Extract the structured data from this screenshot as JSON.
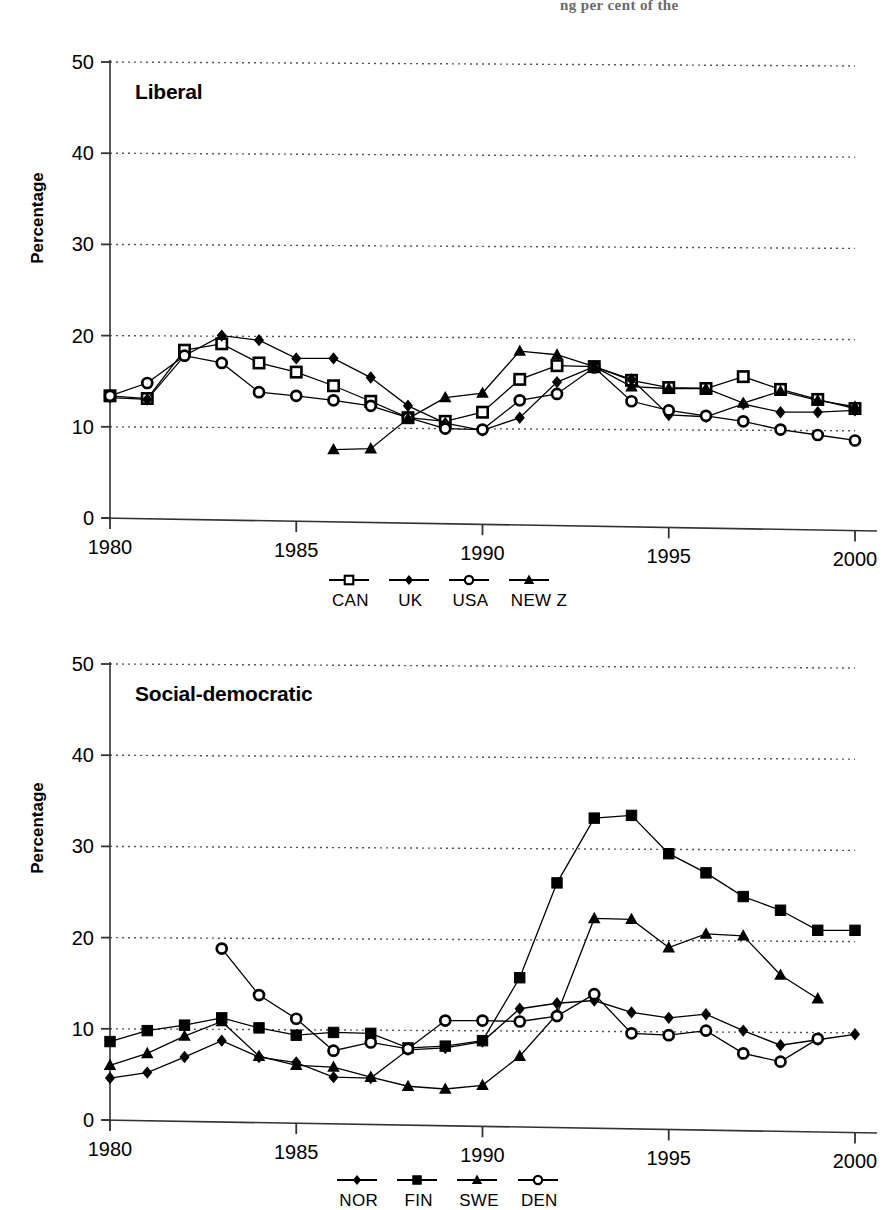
{
  "page": {
    "partial_header_text": "ng per cent of the"
  },
  "charts": [
    {
      "id": "liberal",
      "title": "Liberal",
      "ylabel": "Percentage",
      "xlabel": "",
      "type": "line",
      "xticks": [
        1980,
        1985,
        1990,
        1995,
        2000
      ],
      "xtick_labels": [
        "1980",
        "1985",
        "1990",
        "1995",
        "2000"
      ],
      "yticks": [
        0,
        10,
        20,
        30,
        40,
        50
      ],
      "ytick_labels": [
        "0",
        "10",
        "20",
        "30",
        "40",
        "50"
      ],
      "xlim": [
        1980,
        2000
      ],
      "ylim": [
        0,
        50
      ],
      "grid": "horizontal-dotted",
      "legend_position": "bottom",
      "series": [
        {
          "name": "CAN",
          "marker": "open-square",
          "x": [
            1980,
            1981,
            1982,
            1983,
            1984,
            1985,
            1986,
            1987,
            1988,
            1989,
            1990,
            1991,
            1992,
            1993,
            1994,
            1995,
            1996,
            1997,
            1998,
            1999,
            2000
          ],
          "values": [
            13.4,
            13.1,
            18.4,
            19.1,
            17.0,
            16.0,
            14.5,
            12.8,
            11.0,
            10.6,
            11.6,
            15.2,
            16.7,
            16.6,
            15.1,
            14.3,
            14.2,
            15.5,
            14.1,
            13.0,
            12.0
          ]
        },
        {
          "name": "UK",
          "marker": "filled-diamond",
          "x": [
            1980,
            1981,
            1982,
            1983,
            1984,
            1985,
            1986,
            1987,
            1988,
            1989,
            1990,
            1991,
            1992,
            1993,
            1994,
            1995,
            1996,
            1997,
            1998,
            1999,
            2000
          ],
          "values": [
            13.2,
            13.0,
            17.8,
            20.0,
            19.5,
            17.5,
            17.5,
            15.4,
            12.3,
            10.4,
            9.6,
            11.0,
            14.9,
            16.6,
            15.2,
            11.3,
            11.1,
            12.5,
            11.6,
            11.6,
            11.8
          ]
        },
        {
          "name": "USA",
          "marker": "open-circle",
          "x": [
            1980,
            1981,
            1982,
            1983,
            1984,
            1985,
            1986,
            1987,
            1988,
            1989,
            1990,
            1991,
            1992,
            1993,
            1994,
            1995,
            1996,
            1997,
            1998,
            1999,
            2000
          ],
          "values": [
            13.4,
            14.8,
            17.8,
            17.0,
            13.8,
            13.4,
            12.9,
            12.3,
            11.0,
            9.8,
            9.7,
            12.9,
            13.6,
            16.5,
            12.8,
            11.8,
            11.2,
            10.6,
            9.7,
            9.1,
            8.5
          ]
        },
        {
          "name": "NEW Z",
          "marker": "filled-triangle",
          "x": [
            1986,
            1987,
            1988,
            1989,
            1990,
            1991,
            1992,
            1993,
            1994,
            1995,
            1996,
            1997,
            1998,
            1999,
            2000
          ],
          "values": [
            7.5,
            7.6,
            10.9,
            13.2,
            13.7,
            18.3,
            17.9,
            16.6,
            14.4,
            14.2,
            14.2,
            12.6,
            13.9,
            12.9,
            12.2
          ]
        }
      ]
    },
    {
      "id": "social-democratic",
      "title": "Social-democratic",
      "ylabel": "Percentage",
      "xlabel": "",
      "type": "line",
      "xticks": [
        1980,
        1985,
        1990,
        1995,
        2000
      ],
      "xtick_labels": [
        "1980",
        "1985",
        "1990",
        "1995",
        "2000"
      ],
      "yticks": [
        0,
        10,
        20,
        30,
        40,
        50
      ],
      "ytick_labels": [
        "0",
        "10",
        "20",
        "30",
        "40",
        "50"
      ],
      "xlim": [
        1980,
        2000
      ],
      "ylim": [
        0,
        50
      ],
      "grid": "horizontal-dotted",
      "legend_position": "bottom",
      "series": [
        {
          "name": "NOR",
          "marker": "filled-diamond",
          "x": [
            1980,
            1981,
            1982,
            1983,
            1984,
            1985,
            1986,
            1987,
            1988,
            1989,
            1990,
            1991,
            1992,
            1993,
            1994,
            1995,
            1996,
            1997,
            1998,
            1999,
            2000
          ],
          "values": [
            4.6,
            5.2,
            6.9,
            8.7,
            6.9,
            6.3,
            4.7,
            4.6,
            7.7,
            7.9,
            8.6,
            12.2,
            12.8,
            13.1,
            11.8,
            11.2,
            11.6,
            9.8,
            8.2,
            8.8,
            9.4
          ]
        },
        {
          "name": "FIN",
          "marker": "filled-square",
          "x": [
            1980,
            1981,
            1982,
            1983,
            1984,
            1985,
            1986,
            1987,
            1988,
            1989,
            1990,
            1991,
            1992,
            1993,
            1994,
            1995,
            1996,
            1997,
            1998,
            1999,
            2000
          ],
          "values": [
            8.6,
            9.8,
            10.4,
            11.2,
            10.1,
            9.3,
            9.6,
            9.5,
            7.9,
            8.1,
            8.7,
            15.6,
            26.0,
            33.1,
            33.4,
            29.2,
            27.1,
            24.5,
            23.0,
            20.8,
            20.8
          ]
        },
        {
          "name": "SWE",
          "marker": "filled-triangle",
          "x": [
            1980,
            1981,
            1982,
            1983,
            1984,
            1985,
            1986,
            1987,
            1988,
            1989,
            1990,
            1991,
            1992,
            1993,
            1994,
            1995,
            1996,
            1997,
            1998,
            1999
          ],
          "values": [
            6.0,
            7.3,
            9.2,
            10.8,
            7.0,
            6.0,
            5.8,
            4.7,
            3.7,
            3.4,
            3.8,
            7.0,
            11.6,
            22.1,
            22.0,
            18.9,
            20.4,
            20.2,
            15.9,
            13.3
          ]
        },
        {
          "name": "DEN",
          "marker": "open-circle",
          "x": [
            1983,
            1984,
            1985,
            1986,
            1987,
            1988,
            1989,
            1990,
            1991,
            1992,
            1993,
            1994,
            1995,
            1996,
            1997,
            1998,
            1999
          ],
          "values": [
            18.8,
            13.7,
            11.1,
            7.6,
            8.5,
            7.8,
            10.9,
            10.9,
            10.8,
            11.4,
            13.8,
            9.5,
            9.3,
            9.8,
            7.3,
            6.4,
            8.9
          ]
        }
      ]
    }
  ]
}
